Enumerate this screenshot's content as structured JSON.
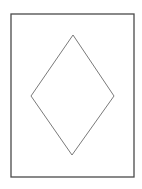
{
  "figure": {
    "background": "#ffffff",
    "frame": {
      "shape": "rectangle",
      "x": 11,
      "y": 14,
      "width": 123,
      "height": 163,
      "stroke": "#4a4a4a",
      "stroke_width": 1.3
    },
    "diamond": {
      "shape": "rhombus",
      "points": "73,35 114,96 72,155 31,96",
      "stroke": "#7a7a7a",
      "stroke_width": 1,
      "fill": "none"
    }
  }
}
